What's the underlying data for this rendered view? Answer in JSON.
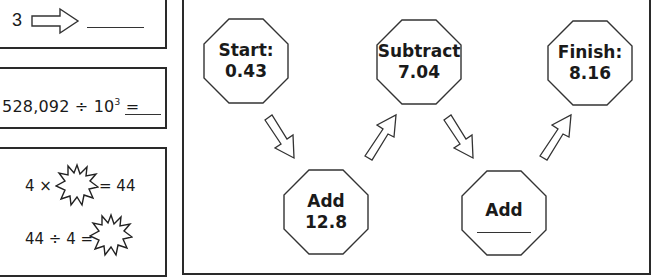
{
  "box1": {
    "number": "3",
    "arrow_icon": "right-arrow-icon"
  },
  "box2": {
    "dividend": "528,092 ÷ 10",
    "exponent": "3",
    "equals": " ="
  },
  "box3": {
    "line1_left": "4 ×",
    "line1_right": "= 44",
    "line2_left": "44 ÷ 4 ="
  },
  "flow": {
    "nodes": [
      {
        "id": "start",
        "line1": "Start:",
        "line2": "0.43"
      },
      {
        "id": "subtract",
        "line1": "Subtract",
        "line2": "7.04"
      },
      {
        "id": "finish",
        "line1": "Finish:",
        "line2": "8.16"
      },
      {
        "id": "add1",
        "line1": "Add",
        "line2": "12.8"
      },
      {
        "id": "add2",
        "line1": "Add",
        "line2": ""
      }
    ]
  },
  "colors": {
    "stroke": "#2a2a2a",
    "background": "#ffffff"
  }
}
